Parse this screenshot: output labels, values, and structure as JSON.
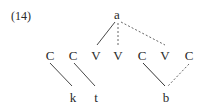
{
  "example_number": "(14)",
  "root": {
    "label": "a",
    "x": 117,
    "y": 15
  },
  "skeleton": [
    {
      "label": "C",
      "x": 50,
      "y": 55
    },
    {
      "label": "C",
      "x": 73,
      "y": 55
    },
    {
      "label": "V",
      "x": 96,
      "y": 55
    },
    {
      "label": "V",
      "x": 117,
      "y": 55
    },
    {
      "label": "C",
      "x": 142,
      "y": 55
    },
    {
      "label": "V",
      "x": 164,
      "y": 55
    },
    {
      "label": "C",
      "x": 189,
      "y": 55
    }
  ],
  "melody": [
    {
      "label": "k",
      "x": 73,
      "y": 97
    },
    {
      "label": "t",
      "x": 96,
      "y": 97
    },
    {
      "label": "b",
      "x": 166,
      "y": 97
    }
  ],
  "associations": [
    {
      "from": "a",
      "to": "skeleton.2",
      "style": "solid"
    },
    {
      "from": "a",
      "to": "skeleton.3",
      "style": "dashed"
    },
    {
      "from": "a",
      "to": "skeleton.5",
      "style": "dashed"
    },
    {
      "from": "skeleton.0",
      "to": "k",
      "style": "solid"
    },
    {
      "from": "skeleton.1",
      "to": "t",
      "style": "solid"
    },
    {
      "from": "skeleton.4",
      "to": "b",
      "style": "solid"
    },
    {
      "from": "skeleton.6",
      "to": "b",
      "style": "dashed"
    }
  ],
  "colors": {
    "ink": "#2a2a2a",
    "background": "#ffffff"
  }
}
